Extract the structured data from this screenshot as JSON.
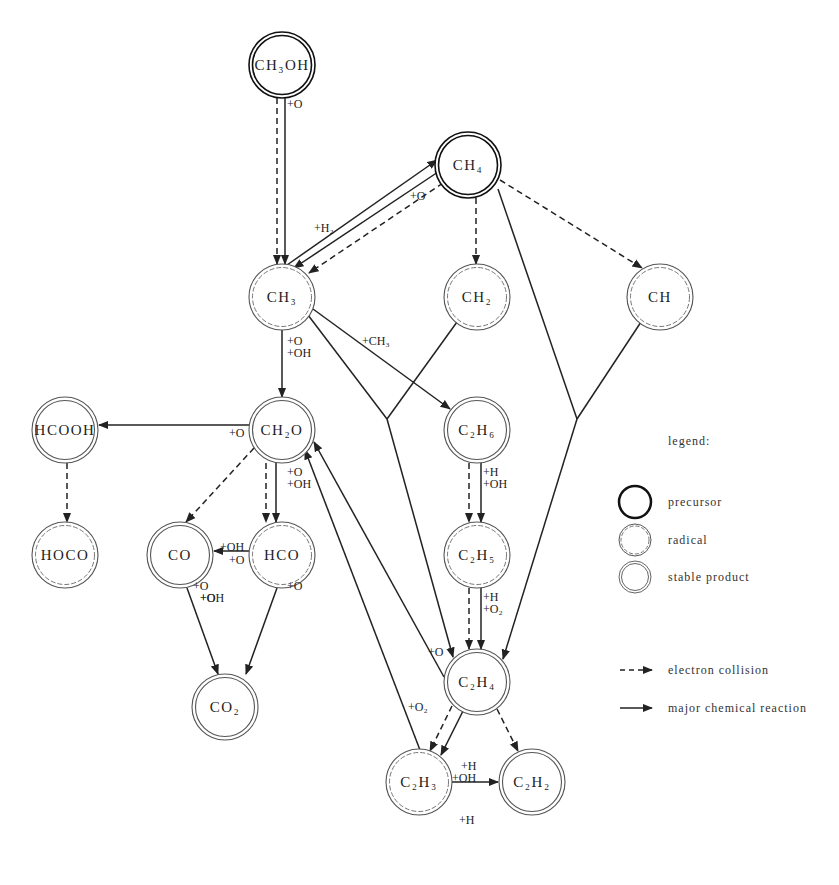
{
  "diagram": {
    "type": "reaction-network",
    "nodes": [
      {
        "id": "CH3OH",
        "label": "CH₃OH",
        "kind": "precursor",
        "x": 282,
        "y": 65
      },
      {
        "id": "CH4",
        "label": "CH₄",
        "kind": "precursor",
        "x": 468,
        "y": 165
      },
      {
        "id": "CH3",
        "label": "CH₃",
        "kind": "radical",
        "x": 282,
        "y": 297
      },
      {
        "id": "CH2",
        "label": "CH₂",
        "kind": "radical",
        "x": 477,
        "y": 297
      },
      {
        "id": "CH",
        "label": "CH",
        "kind": "radical",
        "x": 660,
        "y": 297
      },
      {
        "id": "HCOOH",
        "label": "HCOOH",
        "kind": "stable",
        "x": 65,
        "y": 430
      },
      {
        "id": "CH2O",
        "label": "CH₂O",
        "kind": "stable",
        "x": 282,
        "y": 430
      },
      {
        "id": "C2H6",
        "label": "C₂H₆",
        "kind": "stable",
        "x": 477,
        "y": 430
      },
      {
        "id": "HOCO",
        "label": "HOCO",
        "kind": "radical",
        "x": 65,
        "y": 555
      },
      {
        "id": "CO",
        "label": "CO",
        "kind": "stable",
        "x": 180,
        "y": 555
      },
      {
        "id": "HCO",
        "label": "HCO",
        "kind": "radical",
        "x": 282,
        "y": 555
      },
      {
        "id": "C2H5",
        "label": "C₂H₅",
        "kind": "radical",
        "x": 477,
        "y": 555
      },
      {
        "id": "CO2",
        "label": "CO₂",
        "kind": "stable",
        "x": 225,
        "y": 707
      },
      {
        "id": "C2H4",
        "label": "C₂H₄",
        "kind": "stable",
        "x": 477,
        "y": 682
      },
      {
        "id": "C2H3",
        "label": "C₂H₃",
        "kind": "radical",
        "x": 419,
        "y": 782
      },
      {
        "id": "C2H2",
        "label": "C₂H₂",
        "kind": "stable",
        "x": 532,
        "y": 782
      }
    ],
    "edge_labels": [
      {
        "text": "+O",
        "x": 287,
        "y": 108
      },
      {
        "text": "+H₂",
        "x": 314,
        "y": 232
      },
      {
        "text": "+O",
        "x": 410,
        "y": 200
      },
      {
        "text": "+CH₃",
        "x": 362,
        "y": 345
      },
      {
        "text": "+O",
        "x": 287,
        "y": 345
      },
      {
        "text": "+OH",
        "x": 287,
        "y": 357
      },
      {
        "text": "+O",
        "x": 229,
        "y": 437
      },
      {
        "text": "+O",
        "x": 287,
        "y": 476
      },
      {
        "text": "+OH",
        "x": 287,
        "y": 488
      },
      {
        "text": "+OH",
        "x": 220,
        "y": 551
      },
      {
        "text": "+O",
        "x": 229,
        "y": 564
      },
      {
        "text": "+O",
        "x": 193,
        "y": 590
      },
      {
        "text": "+O",
        "x": 200,
        "y": 602
      },
      {
        "text": "+OH",
        "x": 200,
        "y": 602
      },
      {
        "text": "+O",
        "x": 287,
        "y": 590
      },
      {
        "text": "+H",
        "x": 483,
        "y": 476
      },
      {
        "text": "+OH",
        "x": 483,
        "y": 488
      },
      {
        "text": "+H",
        "x": 483,
        "y": 601
      },
      {
        "text": "+O₂",
        "x": 483,
        "y": 613
      },
      {
        "text": "+O",
        "x": 428,
        "y": 656
      },
      {
        "text": "+O₂",
        "x": 408,
        "y": 711
      },
      {
        "text": "+H",
        "x": 461,
        "y": 770
      },
      {
        "text": "+OH",
        "x": 452,
        "y": 782
      },
      {
        "text": "+H",
        "x": 459,
        "y": 824
      }
    ]
  },
  "legend": {
    "title": "legend:",
    "node_types": [
      {
        "kind": "precursor",
        "label": "precursor"
      },
      {
        "kind": "radical",
        "label": "radical"
      },
      {
        "kind": "stable",
        "label": "stable product"
      }
    ],
    "edge_types": [
      {
        "style": "dashed",
        "label": "electron collision"
      },
      {
        "style": "solid",
        "label": "major chemical reaction"
      }
    ]
  },
  "colors": {
    "line": "#222222",
    "precursor": "#111111",
    "radical": "#555555",
    "stable": "#666666"
  }
}
